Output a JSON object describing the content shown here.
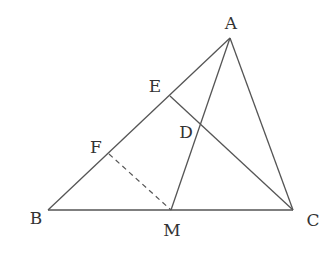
{
  "diagram": {
    "type": "geometry-triangle",
    "points": {
      "A": {
        "label": "A",
        "x": 230,
        "y": 38,
        "lx": 231,
        "ly": 29
      },
      "B": {
        "label": "B",
        "x": 48,
        "y": 210,
        "lx": 36,
        "ly": 224
      },
      "C": {
        "label": "C",
        "x": 293,
        "y": 210,
        "lx": 313,
        "ly": 226
      },
      "M": {
        "label": "M",
        "x": 171,
        "y": 210,
        "lx": 172,
        "ly": 236
      },
      "E": {
        "label": "E",
        "x": 170,
        "y": 96,
        "lx": 155,
        "ly": 92
      },
      "D": {
        "label": "D",
        "x": 200,
        "y": 124,
        "lx": 186,
        "ly": 138
      },
      "F": {
        "label": "F",
        "x": 109,
        "y": 154,
        "lx": 96,
        "ly": 153
      }
    },
    "segments": [
      {
        "from": "A",
        "to": "B",
        "style": "solid"
      },
      {
        "from": "B",
        "to": "C",
        "style": "solid"
      },
      {
        "from": "A",
        "to": "C",
        "style": "solid"
      },
      {
        "from": "A",
        "to": "M",
        "style": "solid"
      },
      {
        "from": "E",
        "to": "C",
        "style": "solid"
      },
      {
        "from": "F",
        "to": "M",
        "style": "dashed"
      }
    ]
  }
}
